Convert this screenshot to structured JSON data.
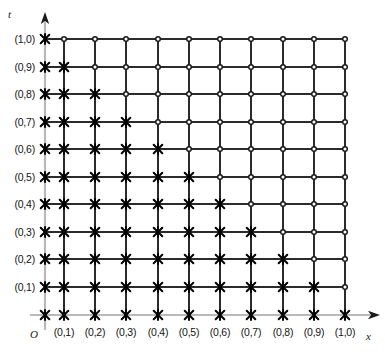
{
  "figure": {
    "title": "",
    "axes": {
      "vertical": {
        "name": "t",
        "arrow": "up-arrow-icon"
      },
      "horizontal": {
        "name": "x",
        "arrow": "right-arrow-icon"
      },
      "origin": {
        "label": "O"
      }
    },
    "y_tick_labels": [
      "(1,0)",
      "(0,9)",
      "(0,8)",
      "(0,7)",
      "(0,6)",
      "(0,5)",
      "(0,4)",
      "(0,3)",
      "(0,2)",
      "(0,1)"
    ],
    "x_tick_labels": [
      "(0,1)",
      "(0,2)",
      "(0,3)",
      "(0,4)",
      "(0,5)",
      "(0,6)",
      "(0,7)",
      "(0,8)",
      "(0,9)",
      "(1,0)"
    ],
    "colors": {
      "grid_line": "#2b2b2b",
      "axis_line": "#b9b9b9",
      "marker_cross": "#000000",
      "marker_circle_stroke": "#1a1a1a",
      "marker_circle_fill": "#ffffff",
      "background": "#ffffff",
      "text": "#141414"
    },
    "marker_legend": {
      "cross": "cross-marker",
      "circle": "circle-marker"
    }
  },
  "chart_data": {
    "type": "scatter",
    "title": "",
    "xlabel": "x",
    "ylabel": "t",
    "grid": true,
    "legend": "none",
    "xlim": [
      0.0,
      1.0
    ],
    "ylim": [
      0.0,
      1.0
    ],
    "x": [
      0.1,
      0.2,
      0.3,
      0.4,
      0.5,
      0.6,
      0.7,
      0.8,
      0.9,
      1.0
    ],
    "y": [
      0.1,
      0.2,
      0.3,
      0.4,
      0.5,
      0.6,
      0.7,
      0.8,
      0.9,
      1.0
    ],
    "x_tick_labels": [
      "(0,1)",
      "(0,2)",
      "(0,3)",
      "(0,4)",
      "(0,5)",
      "(0,6)",
      "(0,7)",
      "(0,8)",
      "(0,9)",
      "(1,0)"
    ],
    "y_tick_labels": [
      "(0,1)",
      "(0,2)",
      "(0,3)",
      "(0,4)",
      "(0,5)",
      "(0,6)",
      "(0,7)",
      "(0,8)",
      "(0,9)",
      "(1,0)"
    ],
    "grid_columns_px": [
      64,
      95,
      126,
      158,
      189,
      220,
      251,
      283,
      314,
      345
    ],
    "grid_rows_px": [
      39,
      67,
      94,
      122,
      149,
      177,
      204,
      232,
      259,
      287,
      315
    ],
    "axis_x_px": 45,
    "axis_y_px": 315,
    "marker_rule": "cross where (column_index + 1) + row_from_bottom_index <= 11, else circle",
    "series": [
      {
        "name": "cross-marker",
        "marker": "cross",
        "points": [
          [
            0.0,
            1.0
          ],
          [
            0.1,
            1.0
          ],
          [
            0.2,
            1.0
          ],
          [
            0.3,
            1.0
          ],
          [
            0.4,
            1.0
          ],
          [
            0.5,
            1.0
          ],
          [
            0.6,
            1.0
          ],
          [
            0.7,
            1.0
          ],
          [
            0.8,
            1.0
          ],
          [
            0.9,
            1.0
          ],
          [
            1.0,
            1.0
          ],
          [
            0.0,
            0.9
          ],
          [
            0.1,
            0.9
          ],
          [
            0.2,
            0.9
          ],
          [
            0.3,
            0.9
          ],
          [
            0.4,
            0.9
          ],
          [
            0.5,
            0.9
          ],
          [
            0.6,
            0.9
          ],
          [
            0.7,
            0.9
          ],
          [
            0.8,
            0.9
          ],
          [
            0.9,
            0.9
          ],
          [
            0.0,
            0.8
          ],
          [
            0.1,
            0.8
          ],
          [
            0.2,
            0.8
          ],
          [
            0.3,
            0.8
          ],
          [
            0.4,
            0.8
          ],
          [
            0.5,
            0.8
          ],
          [
            0.6,
            0.8
          ],
          [
            0.7,
            0.8
          ],
          [
            0.8,
            0.8
          ],
          [
            0.0,
            0.7
          ],
          [
            0.1,
            0.7
          ],
          [
            0.2,
            0.7
          ],
          [
            0.3,
            0.7
          ],
          [
            0.4,
            0.7
          ],
          [
            0.5,
            0.7
          ],
          [
            0.6,
            0.7
          ],
          [
            0.7,
            0.7
          ],
          [
            0.0,
            0.6
          ],
          [
            0.1,
            0.6
          ],
          [
            0.2,
            0.6
          ],
          [
            0.3,
            0.6
          ],
          [
            0.4,
            0.6
          ],
          [
            0.5,
            0.6
          ],
          [
            0.6,
            0.6
          ],
          [
            0.0,
            0.5
          ],
          [
            0.1,
            0.5
          ],
          [
            0.2,
            0.5
          ],
          [
            0.3,
            0.5
          ],
          [
            0.4,
            0.5
          ],
          [
            0.5,
            0.5
          ],
          [
            0.0,
            0.4
          ],
          [
            0.1,
            0.4
          ],
          [
            0.2,
            0.4
          ],
          [
            0.3,
            0.4
          ],
          [
            0.4,
            0.4
          ],
          [
            0.0,
            0.3
          ],
          [
            0.1,
            0.3
          ],
          [
            0.2,
            0.3
          ],
          [
            0.3,
            0.3
          ],
          [
            0.0,
            0.2
          ],
          [
            0.1,
            0.2
          ],
          [
            0.2,
            0.2
          ],
          [
            0.0,
            0.1
          ],
          [
            0.1,
            0.1
          ],
          [
            0.0,
            0.0
          ]
        ]
      },
      {
        "name": "circle-marker",
        "marker": "open-circle",
        "points": [
          [
            1.0,
            0.9
          ],
          [
            0.9,
            0.8
          ],
          [
            1.0,
            0.8
          ],
          [
            0.8,
            0.7
          ],
          [
            0.9,
            0.7
          ],
          [
            1.0,
            0.7
          ],
          [
            0.7,
            0.6
          ],
          [
            0.8,
            0.6
          ],
          [
            0.9,
            0.6
          ],
          [
            1.0,
            0.6
          ],
          [
            0.6,
            0.5
          ],
          [
            0.7,
            0.5
          ],
          [
            0.8,
            0.5
          ],
          [
            0.9,
            0.5
          ],
          [
            1.0,
            0.5
          ],
          [
            0.5,
            0.4
          ],
          [
            0.6,
            0.4
          ],
          [
            0.7,
            0.4
          ],
          [
            0.8,
            0.4
          ],
          [
            0.9,
            0.4
          ],
          [
            1.0,
            0.4
          ],
          [
            0.4,
            0.3
          ],
          [
            0.5,
            0.3
          ],
          [
            0.6,
            0.3
          ],
          [
            0.7,
            0.3
          ],
          [
            0.8,
            0.3
          ],
          [
            0.9,
            0.3
          ],
          [
            1.0,
            0.3
          ],
          [
            0.3,
            0.2
          ],
          [
            0.4,
            0.2
          ],
          [
            0.5,
            0.2
          ],
          [
            0.6,
            0.2
          ],
          [
            0.7,
            0.2
          ],
          [
            0.8,
            0.2
          ],
          [
            0.9,
            0.2
          ],
          [
            1.0,
            0.2
          ],
          [
            0.2,
            0.1
          ],
          [
            0.3,
            0.1
          ],
          [
            0.4,
            0.1
          ],
          [
            0.5,
            0.1
          ],
          [
            0.6,
            0.1
          ],
          [
            0.7,
            0.1
          ],
          [
            0.8,
            0.1
          ],
          [
            0.9,
            0.1
          ],
          [
            1.0,
            0.1
          ],
          [
            0.1,
            0.0
          ],
          [
            0.2,
            0.0
          ],
          [
            0.3,
            0.0
          ],
          [
            0.4,
            0.0
          ],
          [
            0.5,
            0.0
          ],
          [
            0.6,
            0.0
          ],
          [
            0.7,
            0.0
          ],
          [
            0.8,
            0.0
          ],
          [
            0.9,
            0.0
          ],
          [
            1.0,
            0.0
          ]
        ]
      }
    ]
  }
}
